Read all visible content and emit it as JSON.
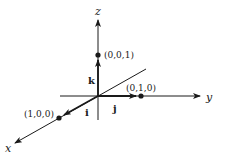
{
  "diagram": {
    "title": "",
    "colors": {
      "ink": "#1a1a1a",
      "background": "#ffffff"
    },
    "axes": [
      {
        "id": "x",
        "label": "x"
      },
      {
        "id": "y",
        "label": "y"
      },
      {
        "id": "z",
        "label": "z"
      }
    ],
    "unit_vectors": [
      {
        "id": "i",
        "label": "i",
        "along": "x"
      },
      {
        "id": "j",
        "label": "j",
        "along": "y"
      },
      {
        "id": "k",
        "label": "k",
        "along": "z"
      }
    ],
    "points": [
      {
        "id": "p100",
        "label": "(1,0,0)"
      },
      {
        "id": "p010",
        "label": "(0,1,0)"
      },
      {
        "id": "p001",
        "label": "(0,0,1)"
      }
    ]
  }
}
